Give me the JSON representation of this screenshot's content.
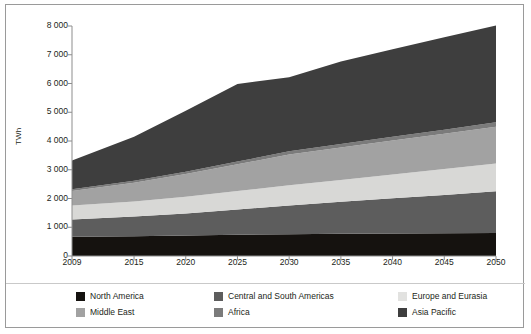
{
  "chart_data": {
    "type": "area",
    "stacked": true,
    "title": "",
    "subtitle": "",
    "xlabel": "",
    "ylabel": "TWh",
    "grid": false,
    "legend_position": "bottom",
    "x": [
      2009,
      2015,
      2020,
      2025,
      2030,
      2035,
      2040,
      2045,
      2050
    ],
    "xtick_labels": [
      "2009",
      "2015",
      "2020",
      "2025",
      "2030",
      "2035",
      "2040",
      "2045",
      "2050"
    ],
    "xlim": [
      2009,
      2050
    ],
    "ylim": [
      0,
      8000
    ],
    "ytick_labels": [
      "0",
      "1 000",
      "2 000",
      "3 000",
      "4 000",
      "5 000",
      "6 000",
      "7 000",
      "8 000"
    ],
    "ytick_values": [
      0,
      1000,
      2000,
      3000,
      4000,
      5000,
      6000,
      7000,
      8000
    ],
    "series": [
      {
        "name": "North America",
        "color": "#15120f",
        "values": [
          670,
          690,
          710,
          740,
          760,
          775,
          785,
          795,
          800
        ]
      },
      {
        "name": "Central and South Americas",
        "color": "#5d5d5d",
        "values": [
          600,
          680,
          770,
          880,
          1000,
          1110,
          1220,
          1330,
          1450
        ]
      },
      {
        "name": "Europe and Eurasia",
        "color": "#d8d8d6",
        "values": [
          490,
          530,
          580,
          640,
          700,
          760,
          830,
          900,
          970
        ]
      },
      {
        "name": "Middle East",
        "color": "#a2a2a2",
        "values": [
          500,
          650,
          790,
          930,
          1070,
          1130,
          1180,
          1230,
          1280
        ]
      },
      {
        "name": "Africa",
        "color": "#7b7b7b",
        "values": [
          60,
          70,
          80,
          95,
          110,
          120,
          130,
          140,
          150
        ]
      },
      {
        "name": "Asia Pacific",
        "color": "#3e3e3e",
        "values": [
          1000,
          1530,
          2120,
          2700,
          2580,
          2870,
          3050,
          3210,
          3370
        ]
      }
    ],
    "stack_totals": [
      3320,
      4150,
      5050,
      5985,
      6220,
      6765,
      7195,
      7605,
      7020
    ],
    "series_order_bottom_to_top": [
      "North America",
      "Central and South Americas",
      "Europe and Eurasia",
      "Middle East",
      "Africa",
      "Asia Pacific"
    ]
  },
  "axis": {
    "y_label": "TWh"
  },
  "legend": {
    "items": [
      {
        "label": "North America",
        "color": "#15120f"
      },
      {
        "label": "Central and South Americas",
        "color": "#5d5d5d"
      },
      {
        "label": "Europe and Eurasia",
        "color": "#e2e2e0"
      },
      {
        "label": "Middle East",
        "color": "#a2a2a2"
      },
      {
        "label": "Africa",
        "color": "#7b7b7b"
      },
      {
        "label": "Asia Pacific",
        "color": "#3e3e3e"
      }
    ]
  }
}
